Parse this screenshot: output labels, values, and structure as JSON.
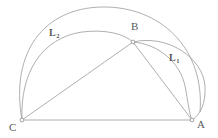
{
  "figure": {
    "background_color": "#ffffff",
    "stroke_color": "#9a9a9a",
    "label_color": "#585858",
    "vertices": [
      {
        "id": "C",
        "label": "C",
        "x": 22,
        "y": 120,
        "marker": "open-circle"
      },
      {
        "id": "A",
        "label": "A",
        "x": 192,
        "y": 120,
        "marker": "open-circle"
      },
      {
        "id": "B",
        "label": "B",
        "x": 133,
        "y": 42,
        "marker": "open-circle"
      }
    ],
    "segments": [
      {
        "id": "CA",
        "from": "C",
        "to": "A",
        "kind": "straight"
      },
      {
        "id": "CB",
        "from": "C",
        "to": "B",
        "kind": "straight"
      },
      {
        "id": "BA",
        "from": "B",
        "to": "A",
        "kind": "straight"
      }
    ],
    "arcs": [
      {
        "id": "outer-arc-CA",
        "from": "C",
        "to": "A",
        "apex_x": 102,
        "apex_y": 7,
        "description": "large outer arc over C to A"
      },
      {
        "id": "mid-arc-CB",
        "from": "C",
        "to": "B",
        "apex_x": 72,
        "apex_y": 33,
        "description": "arc from C to B"
      },
      {
        "id": "semicircle-BA",
        "from": "B",
        "to": "A",
        "apex_x": 207,
        "apex_y": 68,
        "description": "semicircle on diameter BA"
      },
      {
        "id": "inner-arc-BA",
        "from": "B",
        "to": "A",
        "apex_x": 183,
        "apex_y": 72,
        "description": "inner arc from B to A"
      }
    ],
    "region_labels": [
      {
        "id": "L2",
        "letter": "L",
        "subscript": "2",
        "x": 50,
        "y": 30
      },
      {
        "id": "L1",
        "letter": "L",
        "subscript": "1",
        "x": 170,
        "y": 55
      }
    ],
    "vertex_label_positions": [
      {
        "id": "C",
        "x": 10,
        "y": 122
      },
      {
        "id": "A",
        "x": 198,
        "y": 120
      },
      {
        "id": "B",
        "x": 133,
        "y": 23
      }
    ]
  }
}
